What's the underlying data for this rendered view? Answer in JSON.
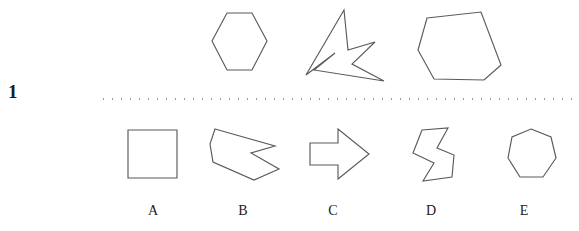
{
  "question": {
    "number": "1",
    "divider": "dotted-separator"
  },
  "prompt_row": {
    "shapes": [
      {
        "name": "hexagon",
        "label": "",
        "sides": 6,
        "points": "32,5 57,5 72,33 57,62 32,62 17,33"
      },
      {
        "name": "concave-star-arrow",
        "label": "",
        "sides": 8,
        "points": "42,4 46,44 73,36 50,58 82,75 12,64 33,47 4,69"
      },
      {
        "name": "irregular-pentagon",
        "label": "",
        "sides": 5,
        "points": "13,11 67,5 87,58 70,73 20,72 4,43"
      }
    ]
  },
  "options_row": {
    "shapes": [
      {
        "name": "square",
        "label": "A",
        "sides": 4,
        "points": "1,1 50,1 50,49 1,49"
      },
      {
        "name": "concave-arrow-polygon",
        "label": "B",
        "sides": 7,
        "points": "6,2 66,19 42,26 70,42 45,53 4,35 1,17"
      },
      {
        "name": "block-arrow-right",
        "label": "C",
        "sides": 7,
        "points": "1,15 29,15 29,1 60,26 29,51 29,37 1,37"
      },
      {
        "name": "zigzag-s-shape",
        "label": "D",
        "sides": 8,
        "points": "10,4 36,2 25,22 42,29 40,51 11,55 22,37 1,27"
      },
      {
        "name": "heptagon",
        "label": "E",
        "sides": 7,
        "points": "25,1 45,9 50,30 37,49 14,49 2,30 6,9"
      }
    ]
  },
  "colors": {
    "stroke": "#5a5a5a",
    "text": "#222222",
    "number": "#1a1a1a",
    "divider_dot": "#9a9a9a",
    "background": "#ffffff"
  }
}
